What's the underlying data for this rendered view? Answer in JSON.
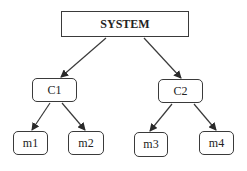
{
  "diagram": {
    "type": "tree",
    "colors": {
      "stroke": "#3a3a3a",
      "fill": "#ffffff",
      "text": "#222222"
    },
    "nodes": [
      {
        "id": "system",
        "label": "SYSTEM",
        "x": 61,
        "y": 11,
        "w": 128,
        "h": 26,
        "shape": "rect"
      },
      {
        "id": "c1",
        "label": "C1",
        "x": 32,
        "y": 78,
        "w": 45,
        "h": 24,
        "shape": "rounded"
      },
      {
        "id": "c2",
        "label": "C2",
        "x": 158,
        "y": 79,
        "w": 45,
        "h": 24,
        "shape": "rounded"
      },
      {
        "id": "m1",
        "label": "m1",
        "x": 13,
        "y": 131,
        "w": 35,
        "h": 24,
        "shape": "rounded"
      },
      {
        "id": "m2",
        "label": "m2",
        "x": 68,
        "y": 131,
        "w": 36,
        "h": 24,
        "shape": "rounded"
      },
      {
        "id": "m3",
        "label": "m3",
        "x": 134,
        "y": 132,
        "w": 34,
        "h": 25,
        "shape": "rounded"
      },
      {
        "id": "m4",
        "label": "m4",
        "x": 199,
        "y": 131,
        "w": 35,
        "h": 24,
        "shape": "rounded"
      }
    ],
    "edges": [
      {
        "from": "system",
        "to": "c1",
        "x1": 106,
        "y1": 38,
        "x2": 61,
        "y2": 77
      },
      {
        "from": "system",
        "to": "c2",
        "x1": 144,
        "y1": 38,
        "x2": 181,
        "y2": 78
      },
      {
        "from": "c1",
        "to": "m1",
        "x1": 50,
        "y1": 103,
        "x2": 32,
        "y2": 130
      },
      {
        "from": "c1",
        "to": "m2",
        "x1": 62,
        "y1": 103,
        "x2": 85,
        "y2": 130
      },
      {
        "from": "c2",
        "to": "m3",
        "x1": 172,
        "y1": 104,
        "x2": 150,
        "y2": 131
      },
      {
        "from": "c2",
        "to": "m4",
        "x1": 194,
        "y1": 104,
        "x2": 216,
        "y2": 130
      }
    ]
  }
}
